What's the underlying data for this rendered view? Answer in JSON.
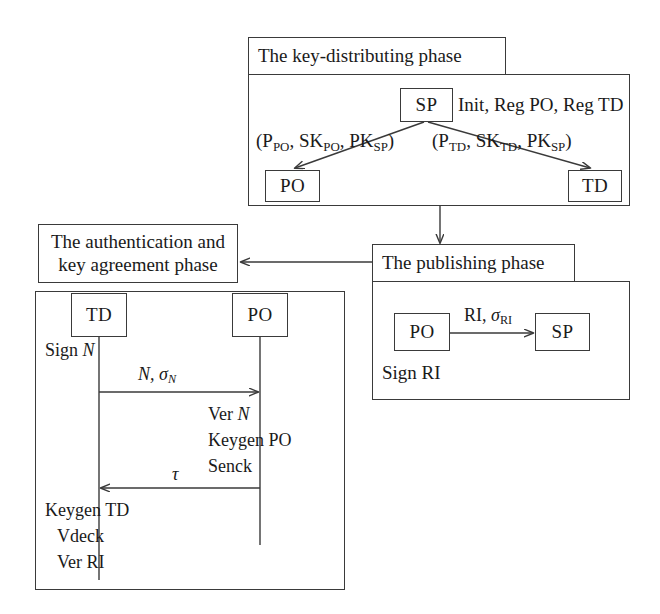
{
  "diagram": {
    "type": "flow-sequence-diagram"
  },
  "phases": {
    "key_distributing": {
      "title": "The key-distributing phase",
      "sp_node": "SP",
      "init_label": "Init, Reg PO, Reg TD",
      "po_node": "PO",
      "td_node": "TD",
      "left_key_label": {
        "open": "(P",
        "sub1": "PO",
        "mid1": ", SK",
        "sub2": "PO",
        "mid2": ", PK",
        "sub3": "SP",
        "close": ")"
      },
      "right_key_label": {
        "open": "(P",
        "sub1": "TD",
        "mid1": ", SK",
        "sub2": "TD",
        "mid2": ", PK",
        "sub3": "SP",
        "close": ")"
      }
    },
    "publishing": {
      "title": "The publishing phase",
      "po_node": "PO",
      "sp_node": "SP",
      "message": {
        "main": "RI, ",
        "sigma": "σ",
        "sub": "RI"
      },
      "footer": "Sign RI"
    },
    "authentication": {
      "title_line1": "The authentication and",
      "title_line2": "key agreement phase",
      "td_node": "TD",
      "po_node": "PO",
      "td_action_1": "Sign ",
      "td_action_1_var": "N",
      "message_1": {
        "main": "N, ",
        "sigma": "σ",
        "sub": "N"
      },
      "po_actions": [
        {
          "text": "Ver ",
          "var": "N"
        },
        {
          "text": "Keygen PO",
          "var": ""
        },
        {
          "text": "Senck",
          "var": ""
        }
      ],
      "message_2": "τ",
      "td_actions": [
        "Keygen TD",
        "Vdeck",
        "Ver RI"
      ]
    }
  },
  "colors": {
    "stroke": "#3a3a3a",
    "text": "#1a1a1a",
    "background": "#ffffff"
  }
}
